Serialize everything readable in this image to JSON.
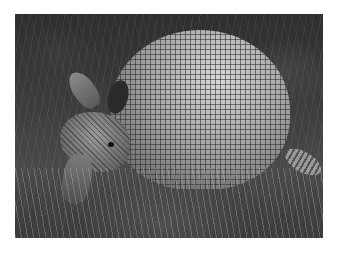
{
  "image": {
    "subject": "nine-banded armadillo",
    "style": "grayscale photograph",
    "background_color": "#ffffff",
    "frame": {
      "left": 15,
      "top": 14,
      "width": 308,
      "height": 224
    }
  }
}
